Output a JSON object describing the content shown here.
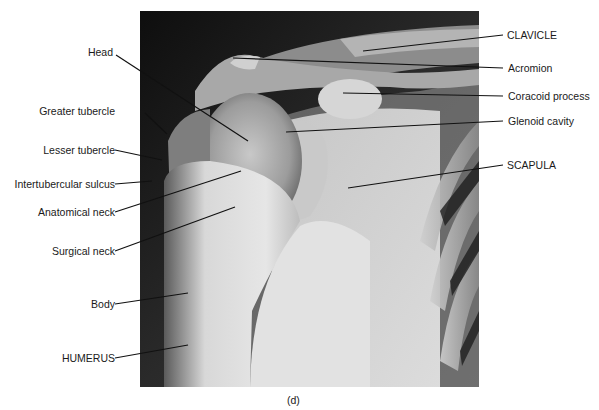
{
  "figure": {
    "caption": "(d)",
    "labels_left": [
      {
        "id": "head",
        "text": "Head"
      },
      {
        "id": "greater-tubercle",
        "text": "Greater tubercle"
      },
      {
        "id": "lesser-tubercle",
        "text": "Lesser tubercle"
      },
      {
        "id": "intertubercular-sulcus",
        "text": "Intertubercular sulcus"
      },
      {
        "id": "anatomical-neck",
        "text": "Anatomical neck"
      },
      {
        "id": "surgical-neck",
        "text": "Surgical neck"
      },
      {
        "id": "body",
        "text": "Body"
      },
      {
        "id": "humerus",
        "text": "HUMERUS"
      }
    ],
    "labels_right": [
      {
        "id": "clavicle",
        "text": "CLAVICLE"
      },
      {
        "id": "acromion",
        "text": "Acromion"
      },
      {
        "id": "coracoid-process",
        "text": "Coracoid process"
      },
      {
        "id": "glenoid-cavity",
        "text": "Glenoid cavity"
      },
      {
        "id": "scapula",
        "text": "SCAPULA"
      }
    ]
  }
}
